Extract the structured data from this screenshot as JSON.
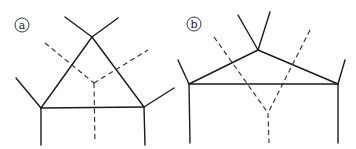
{
  "figure": {
    "panels": [
      {
        "id": "a",
        "label": "a",
        "label_center": [
          22,
          25
        ],
        "solid_segments": [
          [
            [
              92,
              37
            ],
            [
              41,
              108
            ]
          ],
          [
            [
              92,
              37
            ],
            [
              144,
              107
            ]
          ],
          [
            [
              41,
              108
            ],
            [
              144,
              107
            ]
          ],
          [
            [
              92,
              37
            ],
            [
              65,
              17
            ]
          ],
          [
            [
              92,
              37
            ],
            [
              118,
              18
            ]
          ],
          [
            [
              41,
              108
            ],
            [
              16,
              78
            ]
          ],
          [
            [
              41,
              108
            ],
            [
              41,
              145
            ]
          ],
          [
            [
              144,
              107
            ],
            [
              174,
              88
            ]
          ],
          [
            [
              144,
              107
            ],
            [
              145,
              145
            ]
          ]
        ],
        "dashed_segments": [
          [
            [
              45,
              43
            ],
            [
              94,
              83
            ]
          ],
          [
            [
              94,
              83
            ],
            [
              148,
              50
            ]
          ],
          [
            [
              94,
              83
            ],
            [
              95,
              142
            ]
          ]
        ]
      },
      {
        "id": "b",
        "label": "b",
        "label_center": [
          194,
          24
        ],
        "solid_segments": [
          [
            [
              258,
              50
            ],
            [
              189,
              84
            ]
          ],
          [
            [
              258,
              50
            ],
            [
              338,
              84
            ]
          ],
          [
            [
              189,
              84
            ],
            [
              338,
              84
            ]
          ],
          [
            [
              258,
              50
            ],
            [
              238,
              15
            ]
          ],
          [
            [
              258,
              50
            ],
            [
              270,
              12
            ]
          ],
          [
            [
              189,
              84
            ],
            [
              178,
              60
            ]
          ],
          [
            [
              189,
              84
            ],
            [
              190,
              143
            ]
          ],
          [
            [
              338,
              84
            ],
            [
              345,
              60
            ]
          ],
          [
            [
              338,
              84
            ],
            [
              338,
              143
            ]
          ]
        ],
        "dashed_segments": [
          [
            [
              214,
              37
            ],
            [
              268,
              113
            ]
          ],
          [
            [
              310,
              30
            ],
            [
              268,
              113
            ]
          ],
          [
            [
              268,
              113
            ],
            [
              269,
              143
            ]
          ]
        ]
      }
    ]
  }
}
